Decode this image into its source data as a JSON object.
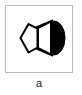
{
  "figure": {
    "caption": "a",
    "frame": {
      "border_color": "#b9b9b9",
      "background_color": "#ffffff"
    },
    "diagram": {
      "name": "pentagonal-solid-with-dark-cap",
      "description": "Black-and-white line drawing of a pentagonal solid seen in perspective with a shaded elliptical cap on the right side",
      "stroke_color": "#000000",
      "fill_light": "#ffffff",
      "fill_dark": "#000000",
      "parts": [
        {
          "name": "pentagon-face",
          "shape": "pentagon",
          "fill": "#ffffff",
          "stroke": "#000000"
        },
        {
          "name": "body-band",
          "shape": "trapezoid",
          "fill": "#ffffff",
          "stroke": "#000000"
        },
        {
          "name": "cap-ellipse",
          "shape": "ellipse-half",
          "fill": "#000000",
          "stroke": "#000000"
        }
      ]
    }
  }
}
